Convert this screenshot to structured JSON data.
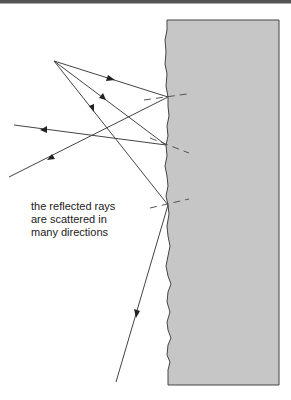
{
  "diagram": {
    "caption": {
      "lines": [
        "the reflected rays",
        "are scattered in",
        "many directions"
      ]
    },
    "colors": {
      "surface_fill": "#c6c6c6",
      "line": "#444444",
      "top_bar": "#555555"
    },
    "source_point": [
      54,
      61
    ],
    "rough_surface": {
      "top": 20,
      "bottom": 385,
      "right": 279
    },
    "rays": [
      {
        "name": "ray-1",
        "incident": [
          [
            54,
            61
          ],
          [
            168,
            97
          ]
        ],
        "reflected": [
          [
            168,
            97
          ],
          [
            9,
            177
          ]
        ]
      },
      {
        "name": "ray-2",
        "incident": [
          [
            54,
            61
          ],
          [
            166,
            145
          ]
        ],
        "reflected": [
          [
            166,
            145
          ],
          [
            14,
            125
          ]
        ]
      },
      {
        "name": "ray-3",
        "incident": [
          [
            54,
            61
          ],
          [
            168,
            205
          ]
        ],
        "reflected": [
          [
            168,
            205
          ],
          [
            116,
            382
          ]
        ]
      }
    ],
    "normals": [
      {
        "from": [
          144,
          100
        ],
        "to": [
          187,
          94
        ]
      },
      {
        "from": [
          150,
          138
        ],
        "to": [
          189,
          153
        ]
      },
      {
        "from": [
          150,
          208
        ],
        "to": [
          189,
          199
        ]
      }
    ]
  }
}
